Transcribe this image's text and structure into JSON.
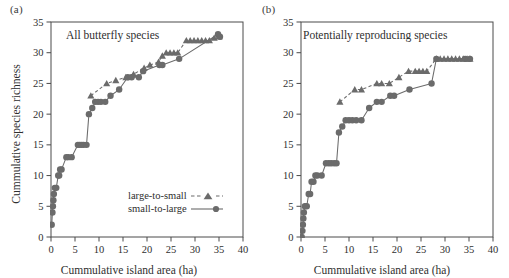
{
  "figure": {
    "background": "#ffffff",
    "marker_color": "#6b6b6b",
    "line_color": "#6b6b6b",
    "axis_color": "#4a4a4a",
    "text_color": "#2f2f2f"
  },
  "axes": {
    "xlabel": "Cummulative island area (ha)",
    "ylabel": "Cummulative species richness",
    "xticks": [
      0,
      5,
      10,
      15,
      20,
      25,
      30,
      35,
      40
    ],
    "yticks": [
      0,
      5,
      10,
      15,
      20,
      25,
      30,
      35
    ],
    "xlim": [
      0,
      40
    ],
    "ylim": [
      0,
      35
    ],
    "grid": false
  },
  "legend": {
    "position": "bottom-right-panel-a",
    "entries": [
      {
        "label": "large-to-small",
        "marker": "triangle",
        "linestyle": "dashed"
      },
      {
        "label": "small-to-large",
        "marker": "circle",
        "linestyle": "solid"
      }
    ]
  },
  "panels": [
    {
      "id": "a",
      "label": "(a)",
      "title": "All butterfly species"
    },
    {
      "id": "b",
      "label": "(b)",
      "title": "Potentially reproducing species"
    }
  ],
  "chart_data": [
    {
      "type": "scatter",
      "panel": "(a)",
      "title": "All butterfly species",
      "xlabel": "Cummulative island area (ha)",
      "ylabel": "Cummulative species richness",
      "xlim": [
        0,
        40
      ],
      "ylim": [
        0,
        35
      ],
      "xticks": [
        0,
        5,
        10,
        15,
        20,
        25,
        30,
        35,
        40
      ],
      "yticks": [
        0,
        5,
        10,
        15,
        20,
        25,
        30,
        35
      ],
      "grid": false,
      "legend_position": "lower right",
      "series": [
        {
          "name": "small-to-large",
          "marker": "circle",
          "linestyle": "solid",
          "color": "#6b6b6b",
          "points": [
            [
              0.15,
              2
            ],
            [
              0.3,
              4
            ],
            [
              0.4,
              5
            ],
            [
              0.5,
              6
            ],
            [
              0.6,
              7
            ],
            [
              0.8,
              8
            ],
            [
              1.1,
              8
            ],
            [
              1.5,
              10
            ],
            [
              1.7,
              10
            ],
            [
              1.9,
              11
            ],
            [
              2.2,
              11
            ],
            [
              3.2,
              13
            ],
            [
              3.6,
              13
            ],
            [
              4.3,
              13
            ],
            [
              5.6,
              15
            ],
            [
              6.0,
              15
            ],
            [
              6.4,
              15
            ],
            [
              6.8,
              15
            ],
            [
              7.4,
              15
            ],
            [
              7.9,
              20
            ],
            [
              8.6,
              21
            ],
            [
              9.2,
              22
            ],
            [
              9.8,
              22
            ],
            [
              10.4,
              22
            ],
            [
              11.3,
              22
            ],
            [
              12.4,
              23
            ],
            [
              14.2,
              24
            ],
            [
              16.0,
              26
            ],
            [
              16.8,
              26
            ],
            [
              18.3,
              26
            ],
            [
              19.2,
              27
            ],
            [
              22.6,
              28
            ],
            [
              23.2,
              28
            ],
            [
              26.7,
              29
            ],
            [
              34.8,
              33
            ],
            [
              35.2,
              32.6
            ]
          ]
        },
        {
          "name": "large-to-small",
          "marker": "triangle",
          "linestyle": "dashed",
          "color": "#6b6b6b",
          "points": [
            [
              8.3,
              23
            ],
            [
              11.6,
              25
            ],
            [
              13.5,
              25.5
            ],
            [
              15.6,
              26
            ],
            [
              17.2,
              26.5
            ],
            [
              19.4,
              27.5
            ],
            [
              20.6,
              28
            ],
            [
              22.4,
              28.5
            ],
            [
              23.2,
              29.5
            ],
            [
              24.0,
              30
            ],
            [
              24.8,
              30
            ],
            [
              25.6,
              30
            ],
            [
              26.4,
              30
            ],
            [
              28.2,
              32
            ],
            [
              29.0,
              32
            ],
            [
              29.8,
              32
            ],
            [
              30.6,
              32
            ],
            [
              31.4,
              32
            ],
            [
              32.2,
              32
            ],
            [
              33.0,
              32
            ],
            [
              34.0,
              32.4
            ],
            [
              35.0,
              32.6
            ]
          ]
        }
      ]
    },
    {
      "type": "scatter",
      "panel": "(b)",
      "title": "Potentially reproducing species",
      "xlabel": "Cummulative island area (ha)",
      "ylabel": "Cummulative species richness",
      "xlim": [
        0,
        40
      ],
      "ylim": [
        0,
        35
      ],
      "xticks": [
        0,
        5,
        10,
        15,
        20,
        25,
        30,
        35,
        40
      ],
      "yticks": [
        0,
        5,
        10,
        15,
        20,
        25,
        30,
        35
      ],
      "grid": false,
      "legend_position": "none",
      "series": [
        {
          "name": "small-to-large",
          "marker": "circle",
          "linestyle": "solid",
          "color": "#6b6b6b",
          "points": [
            [
              0.15,
              0
            ],
            [
              0.3,
              1
            ],
            [
              0.4,
              2
            ],
            [
              0.5,
              3
            ],
            [
              0.6,
              4
            ],
            [
              0.8,
              5
            ],
            [
              1.2,
              5
            ],
            [
              1.6,
              7
            ],
            [
              1.9,
              7
            ],
            [
              2.2,
              9
            ],
            [
              2.6,
              9
            ],
            [
              3.0,
              10
            ],
            [
              3.4,
              10
            ],
            [
              4.3,
              10
            ],
            [
              5.2,
              12
            ],
            [
              5.8,
              12
            ],
            [
              6.3,
              12
            ],
            [
              6.9,
              12
            ],
            [
              7.4,
              12
            ],
            [
              7.9,
              17
            ],
            [
              8.6,
              18
            ],
            [
              9.3,
              19
            ],
            [
              10.0,
              19
            ],
            [
              10.7,
              19
            ],
            [
              11.5,
              19
            ],
            [
              12.6,
              19
            ],
            [
              14.2,
              21
            ],
            [
              15.8,
              22
            ],
            [
              16.8,
              22
            ],
            [
              18.6,
              23
            ],
            [
              19.4,
              23
            ],
            [
              22.6,
              24
            ],
            [
              27.2,
              25
            ],
            [
              28.2,
              29
            ],
            [
              34.2,
              29
            ],
            [
              35.2,
              29
            ]
          ]
        },
        {
          "name": "large-to-small",
          "marker": "triangle",
          "linestyle": "dashed",
          "color": "#6b6b6b",
          "points": [
            [
              8.1,
              22
            ],
            [
              11.2,
              24
            ],
            [
              12.6,
              24
            ],
            [
              15.8,
              25
            ],
            [
              16.8,
              25
            ],
            [
              18.4,
              25
            ],
            [
              20.4,
              26
            ],
            [
              22.4,
              27
            ],
            [
              23.8,
              27
            ],
            [
              24.6,
              27
            ],
            [
              25.4,
              27
            ],
            [
              26.2,
              27
            ],
            [
              28.2,
              29
            ],
            [
              29.0,
              29
            ],
            [
              29.8,
              29
            ],
            [
              30.6,
              29
            ],
            [
              31.4,
              29
            ],
            [
              32.2,
              29
            ],
            [
              33.0,
              29
            ],
            [
              33.8,
              29
            ],
            [
              34.6,
              29
            ],
            [
              35.2,
              29
            ]
          ]
        }
      ]
    }
  ]
}
